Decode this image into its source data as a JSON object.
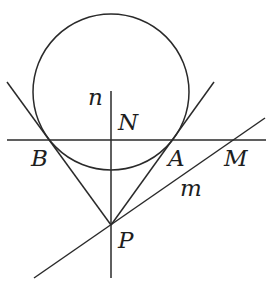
{
  "diagram": {
    "type": "geometry",
    "stroke_color": "#2a2a2a",
    "background": "#ffffff",
    "circle": {
      "cx": 111,
      "cy": 92,
      "r": 78
    },
    "points": {
      "B": {
        "x": 43,
        "y": 140
      },
      "A": {
        "x": 179,
        "y": 140
      },
      "M": {
        "x": 236,
        "y": 140
      },
      "N": {
        "x": 111,
        "y": 140
      },
      "P": {
        "x": 111,
        "y": 225
      }
    },
    "lines": {
      "horizontal_BA": {
        "x1": 7,
        "y1": 140,
        "x2": 266,
        "y2": 140
      },
      "tangent_left": {
        "x1": 7,
        "y1": 82,
        "x2": 111,
        "y2": 225
      },
      "tangent_right": {
        "x1": 214,
        "y1": 82,
        "x2": 111,
        "y2": 225
      },
      "line_n": {
        "x1": 111,
        "y1": 91,
        "x2": 111,
        "y2": 278
      },
      "line_m": {
        "x1": 34,
        "y1": 278,
        "x2": 265,
        "y2": 118
      }
    },
    "labels": {
      "n": "n",
      "N": "N",
      "B": "B",
      "A": "A",
      "M": "M",
      "m": "m",
      "P": "P"
    }
  }
}
